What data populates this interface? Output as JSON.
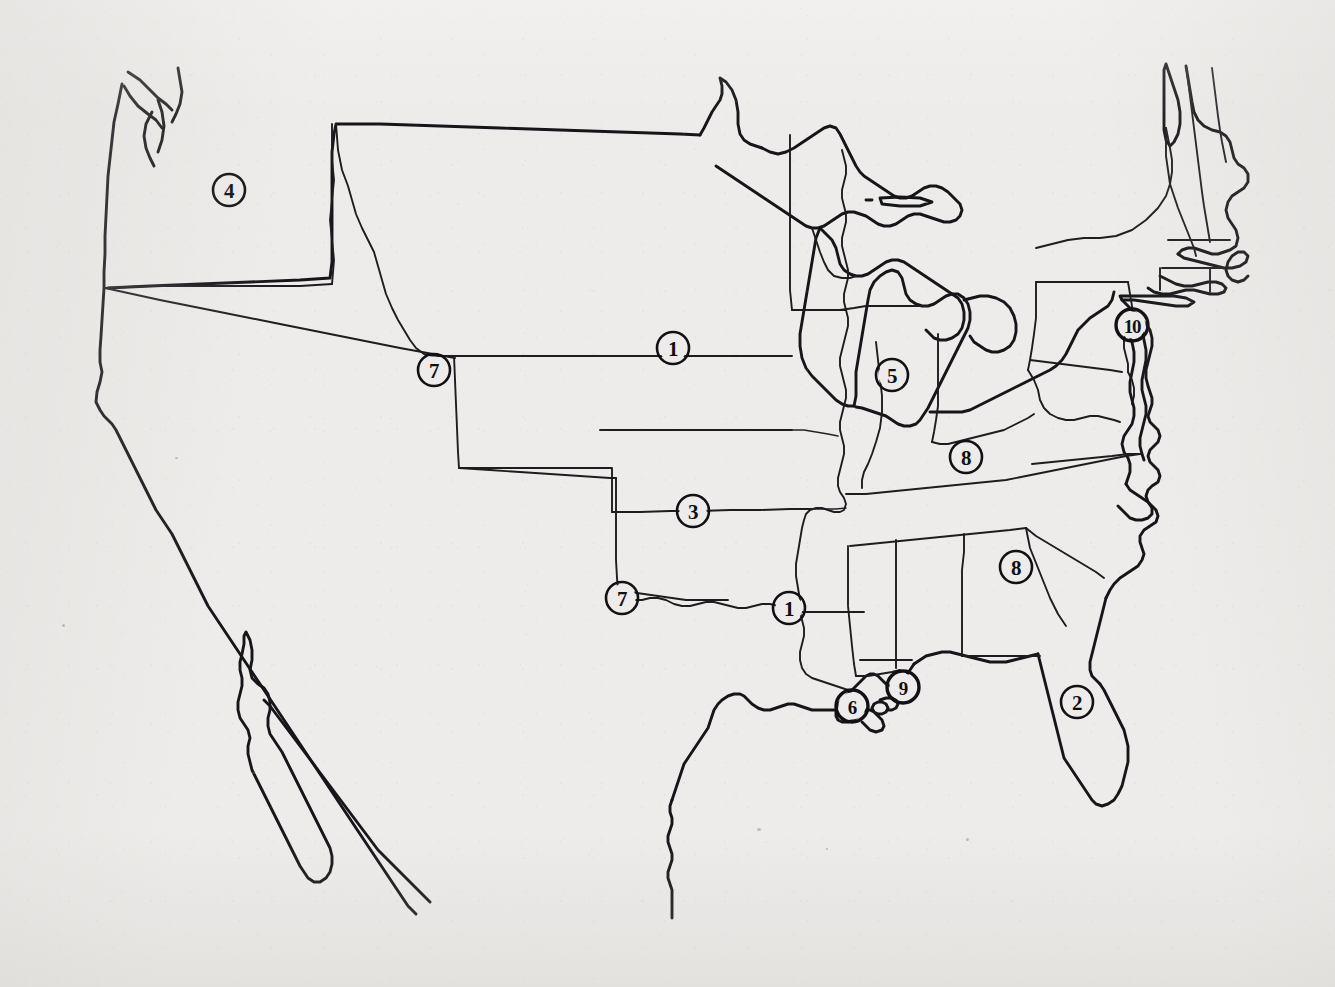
{
  "document": {
    "type": "map",
    "title": "United States Outline Map with Numbered Region Markers",
    "subject": "Contiguous United States",
    "style": "black line-art on photocopied off-white paper",
    "width": 1335,
    "height": 987,
    "background_color": "#edecea",
    "line_color": "#16161a",
    "marker_color": "#101014",
    "has_labels": false,
    "has_legend": false,
    "has_title_text": false
  },
  "markers": [
    {
      "id": "marker-4-pacific-northwest",
      "label": "4",
      "cx": 229,
      "cy": 190,
      "r": 16,
      "weight": "normal",
      "region": "Pacific Northwest",
      "approx_location": "eastern Washington / Oregon border"
    },
    {
      "id": "marker-7-montana-wyoming",
      "label": "7",
      "cx": 434,
      "cy": 370,
      "r": 16,
      "weight": "normal",
      "region": "Northern Rockies",
      "approx_location": "Wyoming / Montana corner"
    },
    {
      "id": "marker-1-great-plains",
      "label": "1",
      "cx": 673,
      "cy": 348,
      "r": 16,
      "weight": "normal",
      "region": "Great Plains",
      "approx_location": "Nebraska / South Dakota"
    },
    {
      "id": "marker-5-illinois-indiana",
      "label": "5",
      "cx": 892,
      "cy": 375,
      "r": 16,
      "weight": "normal",
      "region": "Midwest",
      "approx_location": "Illinois / Indiana border"
    },
    {
      "id": "marker-8-kentucky",
      "label": "8",
      "cx": 966,
      "cy": 457,
      "r": 16,
      "weight": "normal",
      "region": "Upper South",
      "approx_location": "Kentucky"
    },
    {
      "id": "marker-10-philadelphia",
      "label": "10",
      "cx": 1132,
      "cy": 325,
      "r": 16,
      "weight": "heavy",
      "region": "Mid-Atlantic",
      "approx_location": "Philadelphia / New Jersey"
    },
    {
      "id": "marker-3-kansas-oklahoma",
      "label": "3",
      "cx": 693,
      "cy": 511,
      "r": 16,
      "weight": "normal",
      "region": "Central Plains",
      "approx_location": "Kansas / Oklahoma state line"
    },
    {
      "id": "marker-7-texas-panhandle",
      "label": "7",
      "cx": 622,
      "cy": 598,
      "r": 16,
      "weight": "normal",
      "region": "Southern Plains",
      "approx_location": "Texas panhandle / New Mexico"
    },
    {
      "id": "marker-1-arkansas-mississippi",
      "label": "1",
      "cx": 789,
      "cy": 608,
      "r": 16,
      "weight": "normal",
      "region": "Lower Mississippi Valley",
      "approx_location": "Arkansas / Mississippi border"
    },
    {
      "id": "marker-8-georgia",
      "label": "8",
      "cx": 1016,
      "cy": 567,
      "r": 16,
      "weight": "normal",
      "region": "Deep South",
      "approx_location": "Georgia / South Carolina"
    },
    {
      "id": "marker-6-new-orleans",
      "label": "6",
      "cx": 852,
      "cy": 706,
      "r": 16,
      "weight": "heavy",
      "region": "Gulf Coast",
      "approx_location": "southeastern Louisiana / New Orleans"
    },
    {
      "id": "marker-9-mobile-bay",
      "label": "9",
      "cx": 903,
      "cy": 687,
      "r": 16,
      "weight": "heavy",
      "region": "Gulf Coast",
      "approx_location": "Mobile Bay, Alabama"
    },
    {
      "id": "marker-2-florida",
      "label": "2",
      "cx": 1077,
      "cy": 702,
      "r": 16,
      "weight": "normal",
      "region": "Florida Peninsula",
      "approx_location": "central Florida"
    }
  ],
  "marker_value_summary": {
    "distinct_values": [
      "1",
      "2",
      "3",
      "4",
      "5",
      "6",
      "7",
      "8",
      "9",
      "10"
    ],
    "total_markers": 13,
    "repeated_values": [
      "1",
      "7",
      "8"
    ]
  }
}
